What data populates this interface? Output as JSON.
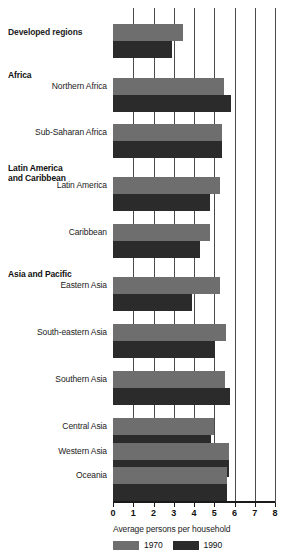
{
  "chart_data": {
    "type": "bar",
    "orientation": "horizontal",
    "title": "",
    "xlabel": "Average persons per household",
    "ylabel": "",
    "xlim": [
      0,
      8
    ],
    "xticks": [
      0,
      1,
      2,
      3,
      4,
      5,
      6,
      7,
      8
    ],
    "xticklabels": [
      "0",
      "1",
      "2",
      "3",
      "4",
      "5",
      "6",
      "7",
      "8"
    ],
    "grid": true,
    "grid_axis": "x",
    "legend_position": "bottom-left",
    "categories": [
      "Developed regions",
      "Northern Africa",
      "Sub-Saharan Africa",
      "Latin America",
      "Caribbean",
      "Eastern Asia",
      "South-eastern Asia",
      "Southern Asia",
      "Central Asia",
      "Western Asia",
      "Oceania"
    ],
    "group_headers": [
      "Africa",
      "Latin America\nand Caribbean",
      "Asia and Pacific"
    ],
    "series": [
      {
        "name": "1970",
        "color": "#6e6e6e",
        "values": [
          3.45,
          5.5,
          5.4,
          5.3,
          4.8,
          5.3,
          5.6,
          5.55,
          5.0,
          5.75,
          5.65
        ]
      },
      {
        "name": "1990",
        "color": "#2b2b2b",
        "values": [
          2.9,
          5.85,
          5.4,
          4.8,
          4.3,
          3.9,
          5.05,
          5.8,
          4.85,
          5.75,
          5.65
        ]
      }
    ]
  },
  "rows": [
    {
      "label": "Developed regions",
      "bold": true,
      "header": null,
      "top": 24,
      "v1970": 3.45,
      "v1990": 2.9
    },
    {
      "label": "Northern Africa",
      "bold": false,
      "header": "Africa",
      "top": 78,
      "v1970": 5.5,
      "v1990": 5.85
    },
    {
      "label": "Sub-Saharan Africa",
      "bold": false,
      "header": null,
      "top": 124,
      "v1970": 5.4,
      "v1990": 5.4
    },
    {
      "label": "Latin America",
      "bold": false,
      "header": "Latin America\nand Caribbean",
      "top": 177,
      "v1970": 5.3,
      "v1990": 4.8
    },
    {
      "label": "Caribbean",
      "bold": false,
      "header": null,
      "top": 224,
      "v1970": 4.8,
      "v1990": 4.3
    },
    {
      "label": "Eastern Asia",
      "bold": false,
      "header": "Asia and Pacific",
      "top": 277,
      "v1970": 5.3,
      "v1990": 3.9
    },
    {
      "label": "South-eastern Asia",
      "bold": false,
      "header": null,
      "top": 324,
      "v1970": 5.6,
      "v1990": 5.05
    },
    {
      "label": "Southern Asia",
      "bold": false,
      "header": null,
      "top": 371,
      "v1970": 5.55,
      "v1990": 5.8
    },
    {
      "label": "Central Asia",
      "bold": false,
      "header": null,
      "top": 418,
      "v1970": 5.0,
      "v1990": 4.85
    },
    {
      "label": "Western Asia",
      "bold": false,
      "header": null,
      "top": 443,
      "v1970": 5.75,
      "v1990": 5.75
    },
    {
      "label": "Oceania",
      "bold": false,
      "header": null,
      "top": 467,
      "v1970": 5.65,
      "v1990": 5.65
    }
  ],
  "headers": [
    {
      "text": "Africa",
      "top": 70
    },
    {
      "text": "Latin America\nand Caribbean",
      "top": 163
    },
    {
      "text": "Asia and Pacific",
      "top": 269
    }
  ],
  "axis": {
    "xtitle": "Average persons per household"
  },
  "legend": {
    "items": [
      {
        "label": "1970",
        "color": "#6e6e6e"
      },
      {
        "label": "1990",
        "color": "#2b2b2b"
      }
    ]
  }
}
